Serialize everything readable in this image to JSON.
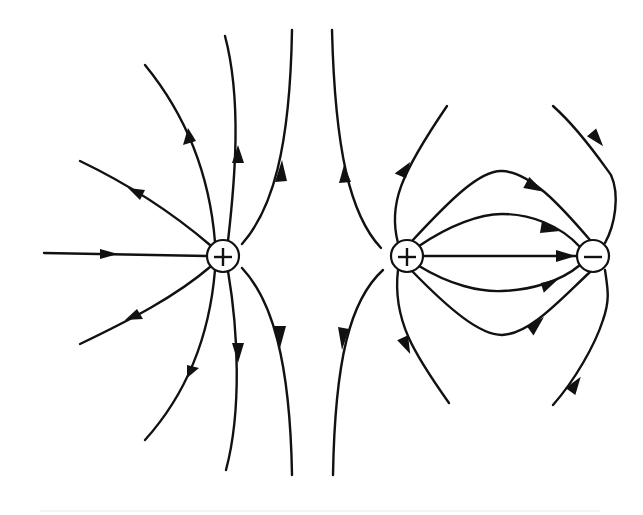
{
  "diagram": {
    "panels": [
      {
        "name": "isolated-positive-charge",
        "charge_sign": "+",
        "center": [
          223,
          256
        ],
        "radius": 16,
        "field_direction": "outward",
        "line_count": 9
      },
      {
        "name": "dipole",
        "charges": [
          {
            "sign": "+",
            "center": [
              407,
              256
            ],
            "radius": 16
          },
          {
            "sign": "−",
            "center": [
              593,
              256
            ],
            "radius": 16
          }
        ],
        "field_direction": "positive-to-negative",
        "line_count": 9
      }
    ],
    "labels": {
      "plus": "+",
      "minus": "−"
    },
    "colors": {
      "line": "#111111",
      "background": "#ffffff",
      "charge_fill": "#ffffff"
    }
  }
}
